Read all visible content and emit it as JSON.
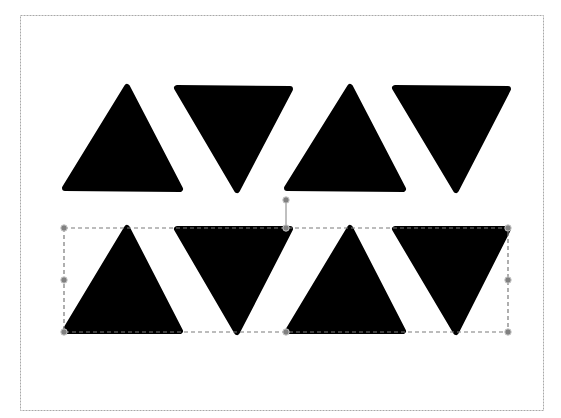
{
  "canvas": {
    "width": 561,
    "height": 418,
    "background": "#ffffff",
    "page_border_color": "#a8a8a8"
  },
  "page_frame": {
    "x": 20,
    "y": 15,
    "width": 523,
    "height": 395
  },
  "shape_fill": "#000000",
  "shapes": [
    {
      "name": "triangle-up-row1-1",
      "row": 1,
      "direction": "up",
      "points": "127,87 180,189 65,188"
    },
    {
      "name": "triangle-down-row1-2",
      "row": 1,
      "direction": "down",
      "points": "177,88 290,89 237,190"
    },
    {
      "name": "triangle-up-row1-3",
      "row": 1,
      "direction": "up",
      "points": "350,87 403,189 287,188"
    },
    {
      "name": "triangle-down-row1-4",
      "row": 1,
      "direction": "down",
      "points": "395,88 508,89 456,190"
    },
    {
      "name": "triangle-up-row2-1",
      "row": 2,
      "direction": "up",
      "points": "127,228 180,331 65,331"
    },
    {
      "name": "triangle-down-row2-2",
      "row": 2,
      "direction": "down",
      "points": "177,229 290,229 237,332"
    },
    {
      "name": "triangle-up-row2-3",
      "row": 2,
      "direction": "up",
      "points": "350,228 403,331 288,331"
    },
    {
      "name": "triangle-down-row2-4",
      "row": 2,
      "direction": "down",
      "points": "395,229 508,229 456,332"
    }
  ],
  "selection": {
    "box": {
      "x": 64,
      "y": 228,
      "width": 444,
      "height": 104
    },
    "border_color": "#7a7a7a",
    "handle_color": "#808080",
    "rotation_handle": {
      "x": 286,
      "y": 200
    },
    "handles": [
      {
        "name": "top-left",
        "x": 64,
        "y": 228
      },
      {
        "name": "top-middle",
        "x": 286,
        "y": 228
      },
      {
        "name": "top-right",
        "x": 508,
        "y": 228
      },
      {
        "name": "middle-left",
        "x": 64,
        "y": 280
      },
      {
        "name": "middle-right",
        "x": 508,
        "y": 280
      },
      {
        "name": "bottom-left",
        "x": 64,
        "y": 332
      },
      {
        "name": "bottom-middle",
        "x": 286,
        "y": 332
      },
      {
        "name": "bottom-right",
        "x": 508,
        "y": 332
      }
    ]
  }
}
